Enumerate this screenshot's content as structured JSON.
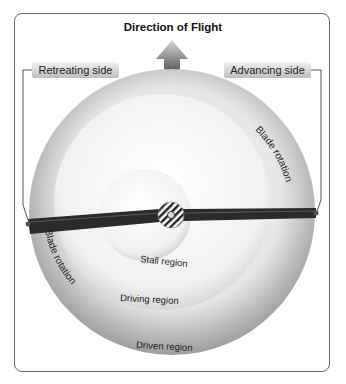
{
  "title": "Direction of Flight",
  "labels": {
    "retreating_side": "Retreating side",
    "advancing_side": "Advancing side",
    "blade_rotation_right": "Blade rotation",
    "blade_rotation_left": "Blade rotation",
    "stall_region": "Stall region",
    "driving_region": "Driving region",
    "driven_region": "Driven region"
  },
  "icons": {
    "direction_arrow": "up-arrow-icon",
    "rotor_hub": "hub-icon"
  },
  "colors": {
    "frame": "#666666",
    "blade": "#2b2b2b",
    "disc_outer": "#9a9a9a",
    "disc_inner": "#f4f4f4"
  }
}
